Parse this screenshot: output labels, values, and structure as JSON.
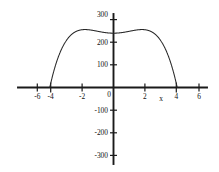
{
  "chart_data": {
    "type": "line",
    "title": "",
    "subtitle": "",
    "xlabel": "x",
    "ylabel": "",
    "xlim": [
      -6,
      6
    ],
    "ylim": [
      -300,
      300
    ],
    "grid": false,
    "legend": null,
    "xticks": [
      -6,
      -4,
      -2,
      0,
      2,
      4,
      6
    ],
    "xtick_labels": [
      "-6",
      "-4",
      "-2",
      "0",
      "2",
      "4",
      "6"
    ],
    "yticks": [
      -300,
      -200,
      -100,
      0,
      100,
      200,
      300
    ],
    "ytick_labels": [
      "-300",
      "-200",
      "-100",
      "0",
      "100",
      "200",
      "300"
    ],
    "series": [
      {
        "name": "curve",
        "color": "#262626",
        "x": [
          -4.45,
          -4.4,
          -4.3,
          -4.2,
          -4.1,
          -4.0,
          -3.9,
          -3.8,
          -3.7,
          -3.6,
          -3.5,
          -3.4,
          -3.3,
          -3.2,
          -3.1,
          -3.0,
          -2.9,
          -2.8,
          -2.7,
          -2.6,
          -2.5,
          -2.4,
          -2.3,
          -2.2,
          -2.1,
          -2.0,
          -1.9,
          -1.8,
          -1.7,
          -1.6,
          -1.5,
          -1.4,
          -1.3,
          -1.2,
          -1.1,
          -1.0,
          -0.9,
          -0.8,
          -0.7,
          -0.6,
          -0.5,
          -0.4,
          -0.3,
          -0.2,
          -0.1,
          0.0,
          0.1,
          0.2,
          0.3,
          0.4,
          0.5,
          0.6,
          0.7,
          0.8,
          0.9,
          1.0,
          1.1,
          1.2,
          1.3,
          1.4,
          1.5,
          1.6,
          1.7,
          1.8,
          1.9,
          2.0,
          2.1,
          2.2,
          2.3,
          2.4,
          2.5,
          2.6,
          2.7,
          2.8,
          2.9,
          3.0,
          3.1,
          3.2,
          3.3,
          3.4,
          3.5,
          3.6,
          3.7,
          3.8,
          3.9,
          4.0,
          4.1,
          4.2,
          4.3,
          4.4,
          4.45
        ],
        "y": [
          -343.8,
          -316.0,
          -263.4,
          -215.2,
          -171.4,
          -132.0,
          -96.8,
          -65.6,
          -38.2,
          -14.4,
          6.0,
          23.3,
          37.6,
          49.2,
          58.2,
          65.0,
          69.7,
          72.5,
          73.7,
          73.4,
          71.9,
          69.2,
          65.6,
          61.2,
          56.1,
          50.6,
          44.7,
          38.7,
          32.5,
          26.4,
          20.4,
          14.6,
          9.0,
          3.8,
          -1.1,
          -5.5,
          -9.5,
          -13.0,
          -15.9,
          -18.2,
          -20.0,
          -21.2,
          -21.8,
          -22.1,
          -22.1,
          -22.1,
          -22.1,
          -22.1,
          -21.8,
          -21.2,
          -20.0,
          -18.2,
          -15.9,
          -13.0,
          -9.5,
          -5.5,
          -1.1,
          3.8,
          9.0,
          14.6,
          20.4,
          26.4,
          32.5,
          38.7,
          44.7,
          50.6,
          56.1,
          61.2,
          65.6,
          69.2,
          71.9,
          73.4,
          73.7,
          72.5,
          69.7,
          65.0,
          58.2,
          49.2,
          37.6,
          23.3,
          6.0,
          -14.4,
          -38.2,
          -65.6,
          -96.8,
          -132.0,
          -171.4,
          -215.2,
          -263.4,
          -316.0,
          -343.8
        ],
        "description": "Smooth W-shaped even polynomial curve: tangent to the x-axis at x = -2 and x = 2, crossing the x-axis at x = -4 and x = 4, local maxima of about 255 near x = -3.3 and x = 3.3, a central maximum of about 256 at x = 0, and steeply plunging below -300 for |x| greater than 4."
      }
    ],
    "features": {
      "tangential_zeros": [
        -2,
        2
      ],
      "crossing_zeros": [
        -4,
        4
      ],
      "central_maximum": {
        "x": 0,
        "y": 256
      },
      "side_maxima": [
        {
          "x": -3.3,
          "y": 255
        },
        {
          "x": 3.3,
          "y": 255
        }
      ],
      "minima_on_axis": [
        {
          "x": -2,
          "y": 0
        },
        {
          "x": 2,
          "y": 0
        }
      ]
    },
    "style": {
      "background_color": "#ffffff",
      "curve_color": "#262626",
      "axis_color": "#1a1a1a",
      "text_color": "#111111"
    }
  }
}
